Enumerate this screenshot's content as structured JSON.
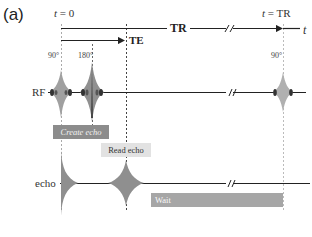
{
  "panel_label": "(a)",
  "timeline": {
    "start_label_var": "t",
    "start_label_val": "= 0",
    "end_label_var": "t",
    "end_label_val": "= TR",
    "axis_label": "t",
    "tr_label": "TR",
    "te_label": "TE"
  },
  "pulses": {
    "first_angle": "90°",
    "second_angle": "180°",
    "repeat_angle": "90°"
  },
  "rows": {
    "rf_label": "RF",
    "echo_label": "echo"
  },
  "phases": {
    "create_echo": "Create echo",
    "read_echo": "Read echo",
    "wait": "Wait"
  },
  "colors": {
    "line": "#222222",
    "dashed": "#555555",
    "dashed_light": "#aaaaaa",
    "create_box": "#8c8c8c",
    "read_box": "#e2e2e2",
    "wait_box": "#a6a6a6",
    "pulse_fill": "#9a9a9a",
    "pulse_dark": "#333333"
  }
}
